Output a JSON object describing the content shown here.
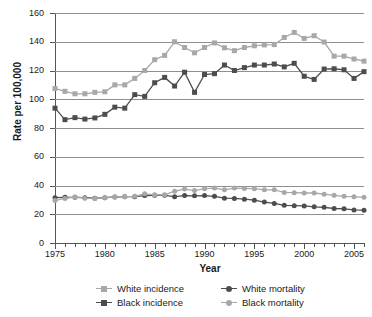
{
  "chart_data": {
    "type": "line",
    "title": "",
    "xlabel": "Year",
    "ylabel": "Rate per 100,000",
    "xlim": [
      1975,
      2006
    ],
    "ylim": [
      0,
      160
    ],
    "ytick_step": 20,
    "xtick_step": 5,
    "xticks": [
      1975,
      1980,
      1985,
      1990,
      1995,
      2000,
      2005
    ],
    "ytick_labels": [
      "0",
      "20",
      "40",
      "60",
      "80",
      "100",
      "120",
      "140",
      "160"
    ],
    "grid": "horizontal",
    "legend_position": "bottom",
    "x": [
      1975,
      1976,
      1977,
      1978,
      1979,
      1980,
      1981,
      1982,
      1983,
      1984,
      1985,
      1986,
      1987,
      1988,
      1989,
      1990,
      1991,
      1992,
      1993,
      1994,
      1995,
      1996,
      1997,
      1998,
      1999,
      2000,
      2001,
      2002,
      2003,
      2004,
      2005,
      2006
    ],
    "series": [
      {
        "name": "White incidence",
        "color": "#a8a8a8",
        "marker": "square",
        "values": [
          107.5,
          105.5,
          103.8,
          103.8,
          104.8,
          105.2,
          110.0,
          110.0,
          114.5,
          120.0,
          127.5,
          130.5,
          140.0,
          136.0,
          132.3,
          136.0,
          139.2,
          135.8,
          133.8,
          136.0,
          137.2,
          137.8,
          138.0,
          143.0,
          146.5,
          142.3,
          144.2,
          139.8,
          130.0,
          130.0,
          128.0,
          126.5
        ]
      },
      {
        "name": "Black incidence",
        "color": "#4d4d4d",
        "marker": "square",
        "values": [
          93.8,
          85.8,
          87.2,
          86.2,
          87.0,
          89.5,
          94.5,
          93.8,
          103.2,
          102.0,
          111.5,
          115.2,
          109.2,
          118.8,
          104.8,
          117.2,
          117.8,
          123.8,
          120.0,
          122.0,
          123.8,
          123.8,
          124.5,
          122.5,
          125.0,
          116.0,
          113.8,
          121.0,
          121.2,
          120.5,
          114.5,
          119.2
        ]
      },
      {
        "name": "White mortality",
        "color": "#4d4d4d",
        "marker": "circle",
        "values": [
          31.5,
          31.8,
          31.8,
          31.5,
          31.2,
          31.5,
          32.0,
          32.2,
          32.2,
          33.0,
          33.2,
          33.2,
          32.2,
          33.0,
          32.8,
          33.0,
          32.5,
          31.2,
          31.0,
          30.5,
          29.8,
          28.5,
          27.5,
          26.2,
          26.0,
          25.8,
          25.2,
          24.8,
          24.0,
          23.8,
          23.0,
          22.8
        ]
      },
      {
        "name": "Black mortality",
        "color": "#a8a8a8",
        "marker": "circle",
        "values": [
          29.5,
          31.0,
          32.0,
          31.2,
          31.0,
          31.5,
          32.0,
          32.2,
          32.5,
          34.2,
          33.5,
          33.5,
          36.0,
          37.5,
          36.5,
          37.8,
          38.2,
          37.0,
          38.2,
          38.0,
          37.8,
          37.0,
          37.0,
          35.2,
          35.0,
          34.8,
          34.8,
          34.0,
          33.2,
          32.5,
          32.2,
          31.8
        ]
      }
    ]
  },
  "legend": {
    "items": [
      {
        "label": "White incidence",
        "color": "#a8a8a8",
        "marker": "square"
      },
      {
        "label": "White mortality",
        "color": "#4d4d4d",
        "marker": "circle"
      },
      {
        "label": "Black incidence",
        "color": "#4d4d4d",
        "marker": "square"
      },
      {
        "label": "Black mortality",
        "color": "#a8a8a8",
        "marker": "circle"
      }
    ]
  }
}
